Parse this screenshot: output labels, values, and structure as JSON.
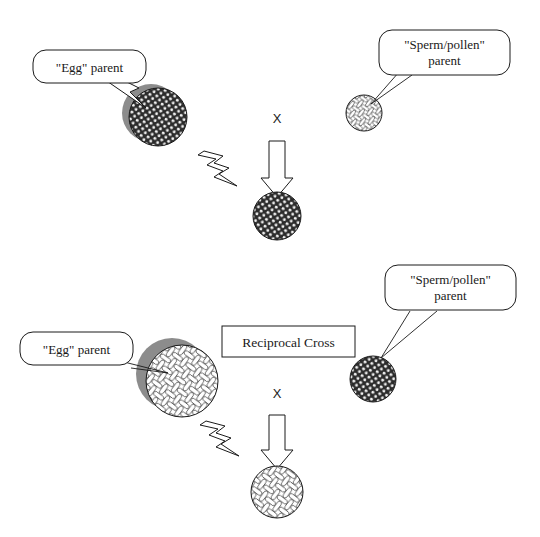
{
  "figure": {
    "background_color": "#ffffff",
    "stroke_color": "#1a1a1a",
    "shadow_color": "#8c8c8c"
  },
  "crosses": [
    {
      "id": "cross-top",
      "egg_parent": {
        "label": "\"Egg\" parent",
        "texture": "dark-stipple",
        "has_shadow": true,
        "size": "large"
      },
      "sperm_parent": {
        "label_line1": "\"Sperm/pollen\"",
        "label_line2": "parent",
        "texture": "light-weave",
        "has_shadow": false,
        "size": "small"
      },
      "cross_symbol": "X",
      "offspring": {
        "texture": "dark-stipple",
        "size": "medium"
      },
      "lightning": "lightning-bolt"
    },
    {
      "id": "cross-bottom",
      "box_label": "Reciprocal Cross",
      "egg_parent": {
        "label": "\"Egg\" parent",
        "texture": "light-weave",
        "has_shadow": true,
        "size": "large"
      },
      "sperm_parent": {
        "label_line1": "\"Sperm/pollen\"",
        "label_line2": "parent",
        "texture": "dark-stipple",
        "has_shadow": false,
        "size": "small"
      },
      "cross_symbol": "X",
      "offspring": {
        "texture": "light-weave",
        "size": "medium"
      },
      "lightning": "lightning-bolt"
    }
  ]
}
